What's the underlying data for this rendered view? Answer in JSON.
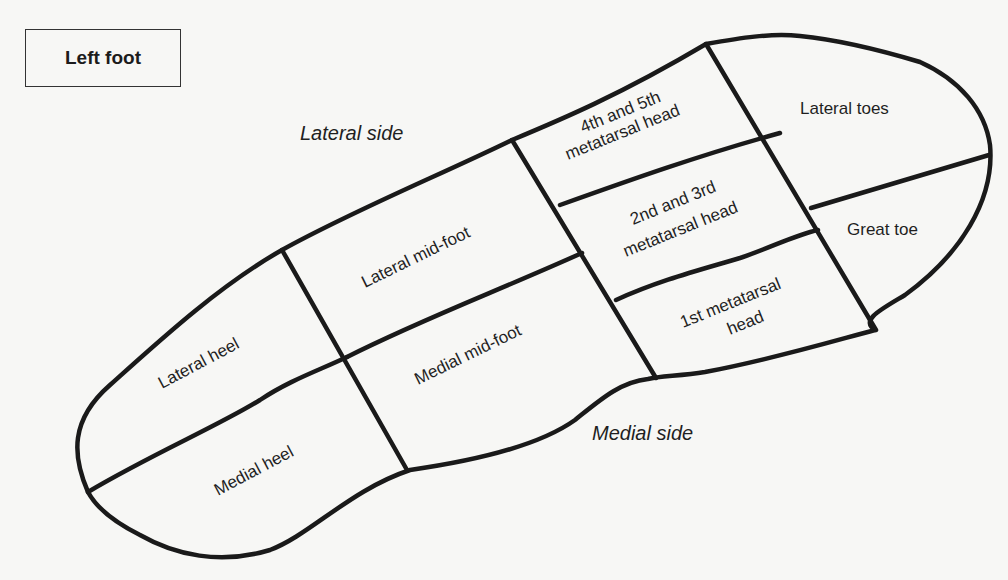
{
  "title": "Left foot",
  "side_labels": {
    "lateral": "Lateral side",
    "medial": "Medial side"
  },
  "regions": [
    {
      "id": "lateral-heel",
      "line1": "Lateral heel"
    },
    {
      "id": "medial-heel",
      "line1": "Medial heel"
    },
    {
      "id": "lateral-mid-foot",
      "line1": "Lateral mid-foot"
    },
    {
      "id": "medial-mid-foot",
      "line1": "Medial mid-foot"
    },
    {
      "id": "4th-5th-metatarsal-head",
      "line1": "4th and 5th",
      "line2": "metatarsal head"
    },
    {
      "id": "2nd-3rd-metatarsal-head",
      "line1": "2nd and 3rd",
      "line2": "metatarsal head"
    },
    {
      "id": "1st-metatarsal-head",
      "line1": "1st metatarsal",
      "line2": "head"
    },
    {
      "id": "lateral-toes",
      "line1": "Lateral toes"
    },
    {
      "id": "great-toe",
      "line1": "Great toe"
    }
  ],
  "colors": {
    "background": "#f7f7f5",
    "stroke": "#1a1a1a"
  }
}
